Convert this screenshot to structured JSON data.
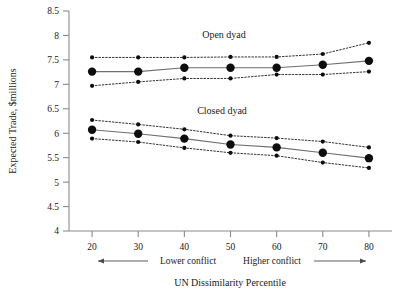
{
  "chart_data": {
    "type": "line",
    "title": "",
    "xlabel": "UN Dissimilarity Percentile",
    "ylabel": "Expected Trade, $millions",
    "x": [
      20,
      30,
      40,
      50,
      60,
      70,
      80
    ],
    "xlim": [
      15,
      85
    ],
    "ylim": [
      4,
      8.5
    ],
    "xticks": [
      "20",
      "30",
      "40",
      "50",
      "60",
      "70",
      "80"
    ],
    "yticks": [
      "4",
      "4.5",
      "5",
      "5.5",
      "6",
      "6.5",
      "7",
      "7.5",
      "8",
      "8.5"
    ],
    "grid": false,
    "legend_position": "inline-annotations",
    "series": [
      {
        "name": "Open dyad",
        "style": "solid-with-markers",
        "values": [
          7.26,
          7.26,
          7.34,
          7.34,
          7.34,
          7.4,
          7.48
        ],
        "ci_upper": {
          "name": "Open dyad upper 95% CI",
          "style": "dotted",
          "values": [
            7.55,
            7.55,
            7.55,
            7.56,
            7.56,
            7.62,
            7.85
          ]
        },
        "ci_lower": {
          "name": "Open dyad lower 95% CI",
          "style": "dotted",
          "values": [
            6.97,
            7.05,
            7.12,
            7.12,
            7.2,
            7.2,
            7.26
          ]
        }
      },
      {
        "name": "Closed dyad",
        "style": "solid-with-markers",
        "values": [
          6.07,
          5.99,
          5.89,
          5.77,
          5.71,
          5.6,
          5.49
        ],
        "ci_upper": {
          "name": "Closed dyad upper 95% CI",
          "style": "dotted",
          "values": [
            6.27,
            6.18,
            6.08,
            5.95,
            5.9,
            5.83,
            5.71
          ]
        },
        "ci_lower": {
          "name": "Closed dyad lower 95% CI",
          "style": "dotted",
          "values": [
            5.89,
            5.82,
            5.7,
            5.6,
            5.54,
            5.4,
            5.29
          ]
        }
      }
    ],
    "annotations": [
      {
        "name": "open-dyad-label",
        "text": "Open dyad",
        "x": 50,
        "y": 7.92
      },
      {
        "name": "closed-dyad-label",
        "text": "Closed dyad",
        "x": 50,
        "y": 6.4
      },
      {
        "name": "lower-conflict-label",
        "text": "Lower conflict"
      },
      {
        "name": "higher-conflict-label",
        "text": "Higher conflict"
      }
    ]
  },
  "axes": {
    "y_title": "Expected Trade, $millions",
    "x_title": "UN Dissimilarity Percentile",
    "y_tick_labels": [
      "8.5",
      "8",
      "7.5",
      "7",
      "6.5",
      "6",
      "5.5",
      "5",
      "4.5",
      "4"
    ],
    "x_tick_labels": [
      "20",
      "30",
      "40",
      "50",
      "60",
      "70",
      "80"
    ]
  },
  "annotations": {
    "open_dyad": "Open dyad",
    "closed_dyad": "Closed dyad",
    "lower_conflict": "Lower conflict",
    "higher_conflict": "Higher conflict"
  },
  "colors": {
    "mean_line": "#6f6f6f",
    "ci_line": "#1a1a1a",
    "marker": "#0d0d0d",
    "axis": "#8a8a8a",
    "text": "#1a1a1a",
    "background": "#ffffff"
  }
}
